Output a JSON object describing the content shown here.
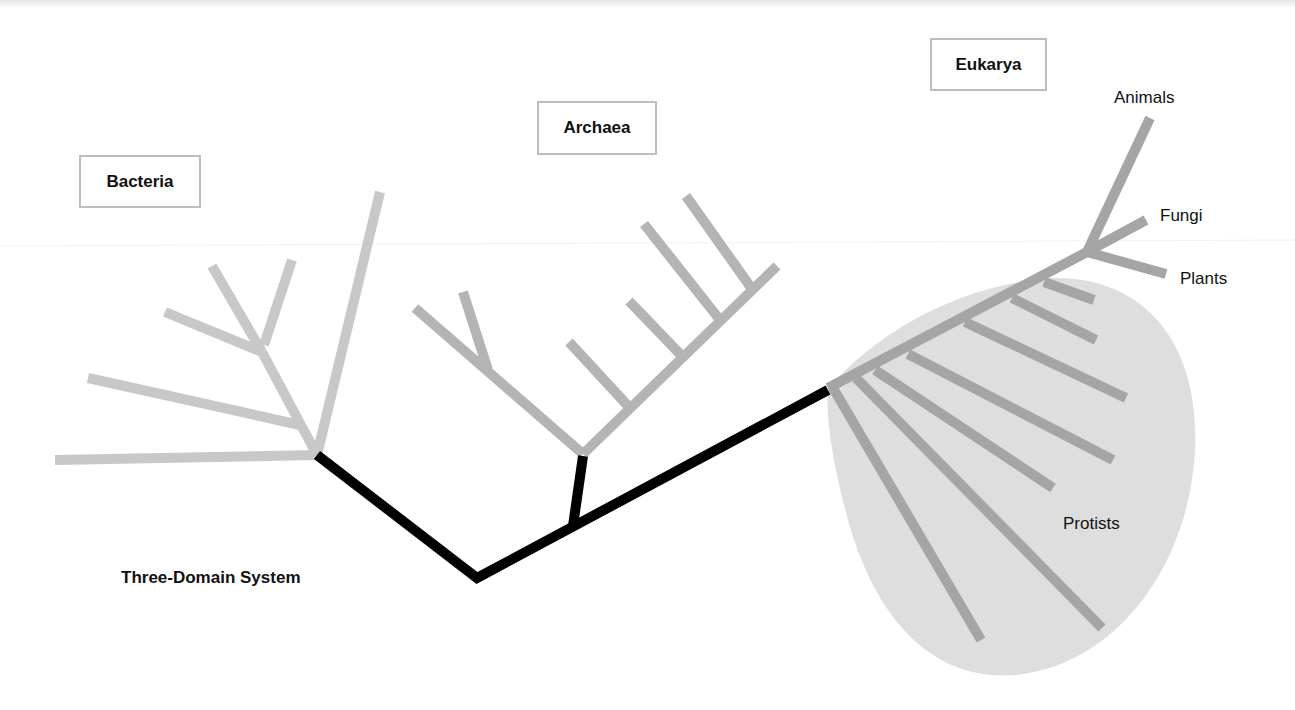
{
  "diagram": {
    "title": "Three-Domain System",
    "domains": [
      {
        "id": "bacteria",
        "label": "Bacteria"
      },
      {
        "id": "archaea",
        "label": "Archaea"
      },
      {
        "id": "eukarya",
        "label": "Eukarya"
      }
    ],
    "eukarya_groups": [
      {
        "id": "animals",
        "label": "Animals"
      },
      {
        "id": "fungi",
        "label": "Fungi"
      },
      {
        "id": "plants",
        "label": "Plants"
      },
      {
        "id": "protists",
        "label": "Protists"
      }
    ],
    "colors": {
      "root_trunk": "#000000",
      "bacteria_branches": "#c8c8c8",
      "archaea_branches": "#b4b4b4",
      "eukarya_branches": "#a5a5a5",
      "protist_region": "#dedede",
      "label_box_border": "#bdbdbd"
    },
    "branch_counts": {
      "bacteria_leaves": 6,
      "archaea_leaves": 7,
      "eukarya_protist_leaves": 9,
      "eukarya_named_leaves": 3
    }
  }
}
